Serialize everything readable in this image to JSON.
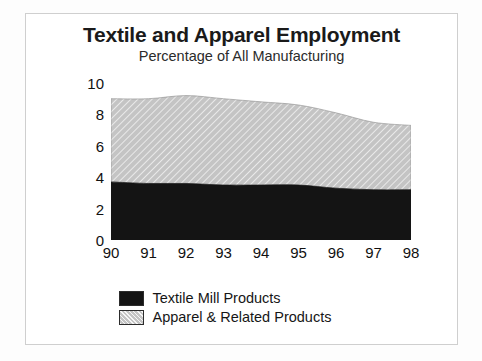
{
  "chart_data": {
    "type": "area",
    "title": "Textile and Apparel Employment",
    "subtitle": "Percentage of All Manufacturing",
    "xlabel": "",
    "ylabel": "",
    "stacked": true,
    "grid": false,
    "legend_position": "bottom",
    "categories": [
      "90",
      "91",
      "92",
      "93",
      "94",
      "95",
      "96",
      "97",
      "98"
    ],
    "x_tick_labels": [
      "90",
      "91",
      "92",
      "93",
      "94",
      "95",
      "96",
      "97",
      "98"
    ],
    "y_tick_labels": [
      "0",
      "2",
      "4",
      "6",
      "8",
      "10"
    ],
    "y_tick_values": [
      0,
      2,
      4,
      6,
      8,
      10
    ],
    "ylim": [
      0,
      10
    ],
    "xlim": [
      "90",
      "98"
    ],
    "series": [
      {
        "name": "Textile Mill Products",
        "color": "#141414",
        "fill": "solid",
        "values": [
          3.7,
          3.6,
          3.6,
          3.5,
          3.5,
          3.5,
          3.3,
          3.2,
          3.2
        ]
      },
      {
        "name": "Apparel & Related Products",
        "color": "#c4c4c4",
        "fill": "diagonal-hatch",
        "values": [
          5.3,
          5.4,
          5.6,
          5.5,
          5.3,
          5.1,
          4.8,
          4.3,
          4.1
        ]
      }
    ],
    "stacked_totals": [
      9.0,
      9.0,
      9.2,
      9.0,
      8.8,
      8.6,
      8.1,
      7.5,
      7.3
    ]
  },
  "legend": {
    "items": [
      {
        "label": "Textile Mill Products",
        "swatch": "black-solid"
      },
      {
        "label": "Apparel & Related Products",
        "swatch": "gray-hatch"
      }
    ]
  }
}
